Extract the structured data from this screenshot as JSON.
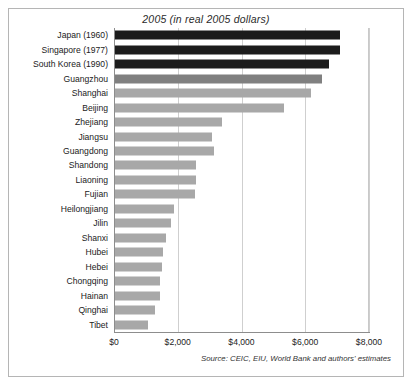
{
  "figure": {
    "title": "2005 (in real 2005 dollars)",
    "source_note": "Source: CEIC, EIU, World Bank and authors' estimates",
    "colors": {
      "benchmark_bar": "#1c1c1c",
      "city_bar": "#808080",
      "province_bar": "#a8a8a8",
      "gridline": "#cfcfcf",
      "axis": "#8d8d8d",
      "frame": "#b5b5b5",
      "text": "#222222"
    }
  },
  "chart_data": {
    "type": "bar",
    "orientation": "horizontal",
    "title": "2005 (in real 2005 dollars)",
    "xlabel": "",
    "ylabel": "",
    "xlim": [
      0,
      8000
    ],
    "grid": true,
    "legend": "none",
    "xticks": [
      0,
      2000,
      4000,
      6000,
      8000
    ],
    "xtick_labels": [
      "$0",
      "$2,000",
      "$4,000",
      "$6,000",
      "$8,000"
    ],
    "categories": [
      "Japan (1960)",
      "Singapore (1977)",
      "South Korea (1990)",
      "Guangzhou",
      "Shanghai",
      "Beijing",
      "Zhejiang",
      "Jiangsu",
      "Guangdong",
      "Shandong",
      "Liaoning",
      "Fujian",
      "Heilongjiang",
      "Jilin",
      "Shanxi",
      "Hubei",
      "Hebei",
      "Chongqing",
      "Hainan",
      "Qinghai",
      "Tibet"
    ],
    "values": [
      7050,
      7050,
      6700,
      6500,
      6150,
      5300,
      3350,
      3050,
      3100,
      2550,
      2550,
      2500,
      1850,
      1750,
      1600,
      1500,
      1480,
      1400,
      1400,
      1250,
      1050
    ],
    "bar_colors": [
      "#1c1c1c",
      "#1c1c1c",
      "#1c1c1c",
      "#808080",
      "#a8a8a8",
      "#a8a8a8",
      "#a8a8a8",
      "#a8a8a8",
      "#a8a8a8",
      "#a8a8a8",
      "#a8a8a8",
      "#a8a8a8",
      "#a8a8a8",
      "#a8a8a8",
      "#a8a8a8",
      "#a8a8a8",
      "#a8a8a8",
      "#a8a8a8",
      "#a8a8a8",
      "#a8a8a8",
      "#a8a8a8"
    ]
  }
}
